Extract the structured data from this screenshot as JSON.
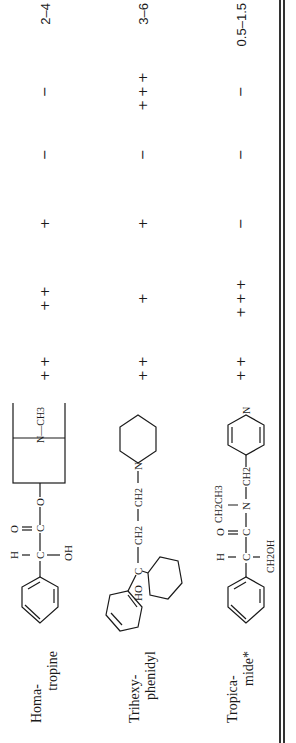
{
  "table": {
    "orientation": "rotated 90° counter-clockwise (text reads bottom-to-top)",
    "value_columns": [
      "col_a",
      "col_b",
      "col_c",
      "col_d",
      "col_e",
      "duration"
    ],
    "rows": [
      {
        "name_line1": "Homa-",
        "name_line2": "tropine",
        "structure_labels": {
          "h": "H",
          "o_carbonyl": "O",
          "oh": "OH",
          "c1": "C",
          "c2": "C",
          "o_ester": "O",
          "n_ch3": "N—CH3"
        },
        "col_a": "++",
        "col_b": "++",
        "col_c": "+",
        "col_d": "−",
        "col_e": "−",
        "duration": "2–4"
      },
      {
        "name_line1": "Trihexy-",
        "name_line2": "phenidyl",
        "structure_labels": {
          "ho": "HO",
          "c": "C",
          "ch2a": "CH2",
          "ch2b": "CH2",
          "n": "N"
        },
        "col_a": "++",
        "col_b": "+",
        "col_c": "+",
        "col_d": "−",
        "col_e": "+++",
        "duration": "3–6"
      },
      {
        "name_line1": "Tropica-",
        "name_line2": "mide*",
        "structure_labels": {
          "h": "H",
          "o": "O",
          "c1": "C",
          "c2": "C",
          "ch2oh": "CH2OH",
          "n": "N",
          "ch2ch3": "CH2CH3",
          "ch2": "CH2",
          "n_pyr": "N"
        },
        "col_a": "++",
        "col_b": "+++",
        "col_c": "−",
        "col_d": "−",
        "col_e": "−",
        "duration": "0.5–1.5"
      }
    ]
  }
}
